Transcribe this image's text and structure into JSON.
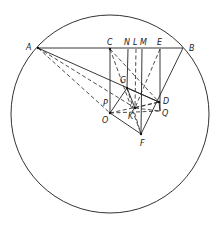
{
  "diagram": {
    "circle": {
      "cx": 110,
      "cy": 114,
      "r": 99
    },
    "points": {
      "A": {
        "x": 38,
        "y": 48
      },
      "B": {
        "x": 183,
        "y": 48
      },
      "C": {
        "x": 110,
        "y": 49
      },
      "N": {
        "x": 128,
        "y": 49
      },
      "L": {
        "x": 136,
        "y": 49
      },
      "M": {
        "x": 142,
        "y": 49
      },
      "E": {
        "x": 160,
        "y": 49
      },
      "G": {
        "x": 127,
        "y": 88
      },
      "D": {
        "x": 159,
        "y": 102
      },
      "K": {
        "x": 135,
        "y": 108
      },
      "O": {
        "x": 110,
        "y": 113
      },
      "Q": {
        "x": 160,
        "y": 111
      },
      "F": {
        "x": 141,
        "y": 134
      }
    },
    "labels": [
      {
        "text": "A",
        "x": 26,
        "y": 50
      },
      {
        "text": "B",
        "x": 189,
        "y": 51
      },
      {
        "text": "C",
        "x": 107,
        "y": 45
      },
      {
        "text": "N",
        "x": 124,
        "y": 45
      },
      {
        "text": "L",
        "x": 133,
        "y": 45
      },
      {
        "text": "M",
        "x": 140,
        "y": 45
      },
      {
        "text": "E",
        "x": 157,
        "y": 45
      },
      {
        "text": "G",
        "x": 120,
        "y": 83
      },
      {
        "text": "D",
        "x": 163,
        "y": 104
      },
      {
        "text": "P",
        "x": 103,
        "y": 106
      },
      {
        "text": "O",
        "x": 102,
        "y": 123
      },
      {
        "text": "K",
        "x": 128,
        "y": 119
      },
      {
        "text": "Q",
        "x": 162,
        "y": 116
      },
      {
        "text": "F",
        "x": 140,
        "y": 146
      }
    ],
    "solid_lines": [
      [
        "A",
        "B"
      ],
      [
        "A",
        "D"
      ],
      [
        "C",
        "O"
      ],
      [
        "E",
        "Q"
      ],
      [
        "B",
        "F"
      ],
      [
        "O",
        "F"
      ],
      [
        "G",
        "D"
      ],
      [
        "G",
        "O"
      ],
      [
        "N",
        "G"
      ],
      [
        "M",
        "F"
      ],
      [
        "G",
        "K"
      ],
      [
        "D",
        "Q"
      ]
    ],
    "dashed_lines": [
      [
        "A",
        "O"
      ],
      [
        "A",
        "K"
      ],
      [
        "C",
        "D"
      ],
      [
        "C",
        "F"
      ],
      [
        "E",
        "K"
      ],
      [
        "L",
        "K"
      ],
      [
        "O",
        "D"
      ],
      [
        "O",
        "Q"
      ],
      [
        "K",
        "D"
      ],
      [
        "G",
        "F"
      ],
      [
        "K",
        "Q"
      ]
    ]
  }
}
